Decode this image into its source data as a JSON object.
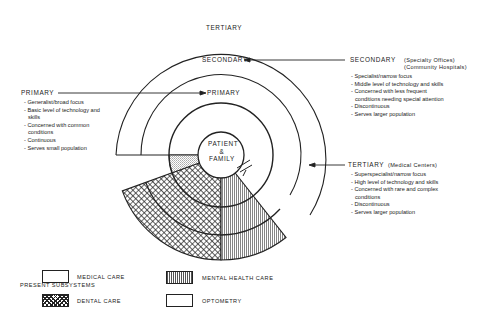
{
  "diagram": {
    "rings": {
      "center": "PATIENT & FAMILY",
      "center_lines": [
        "PATIENT",
        "&",
        "FAMILY"
      ],
      "primary": "PRIMARY",
      "secondary": "SECONDARY",
      "tertiary": "TERTIARY"
    },
    "primary": {
      "heading": "PRIMARY",
      "items": [
        "Generalist/broad focus",
        "Basic level of technology and skills",
        "Concerned with common conditions",
        "Continuous",
        "Serves small population"
      ]
    },
    "secondary": {
      "heading": "SECONDARY",
      "qualifier_1": "(Specialty Offices)",
      "qualifier_2": "(Community Hospitals)",
      "items": [
        "Specialist/narrow focus",
        "Middle level of technology and skills",
        "Concerned with less frequent conditions needing special attention",
        "Discontinuous",
        "Serves larger population"
      ]
    },
    "tertiary": {
      "heading": "TERTIARY",
      "qualifier": "(Medical Centers)",
      "items": [
        "Superspecialist/narrow focus",
        "High level of technology and skills",
        "Concerned with rare and complex conditions",
        "Discontinuous",
        "Serves larger population"
      ]
    }
  },
  "legend": {
    "title": "PRESENT SUBSYSTEMS",
    "entries": [
      {
        "label": "MEDICAL CARE",
        "pattern": "blank"
      },
      {
        "label": "MENTAL HEALTH CARE",
        "pattern": "vertical-lines"
      },
      {
        "label": "DENTAL CARE",
        "pattern": "crosshatch"
      },
      {
        "label": "OPTOMETRY",
        "pattern": "stipple"
      }
    ]
  }
}
